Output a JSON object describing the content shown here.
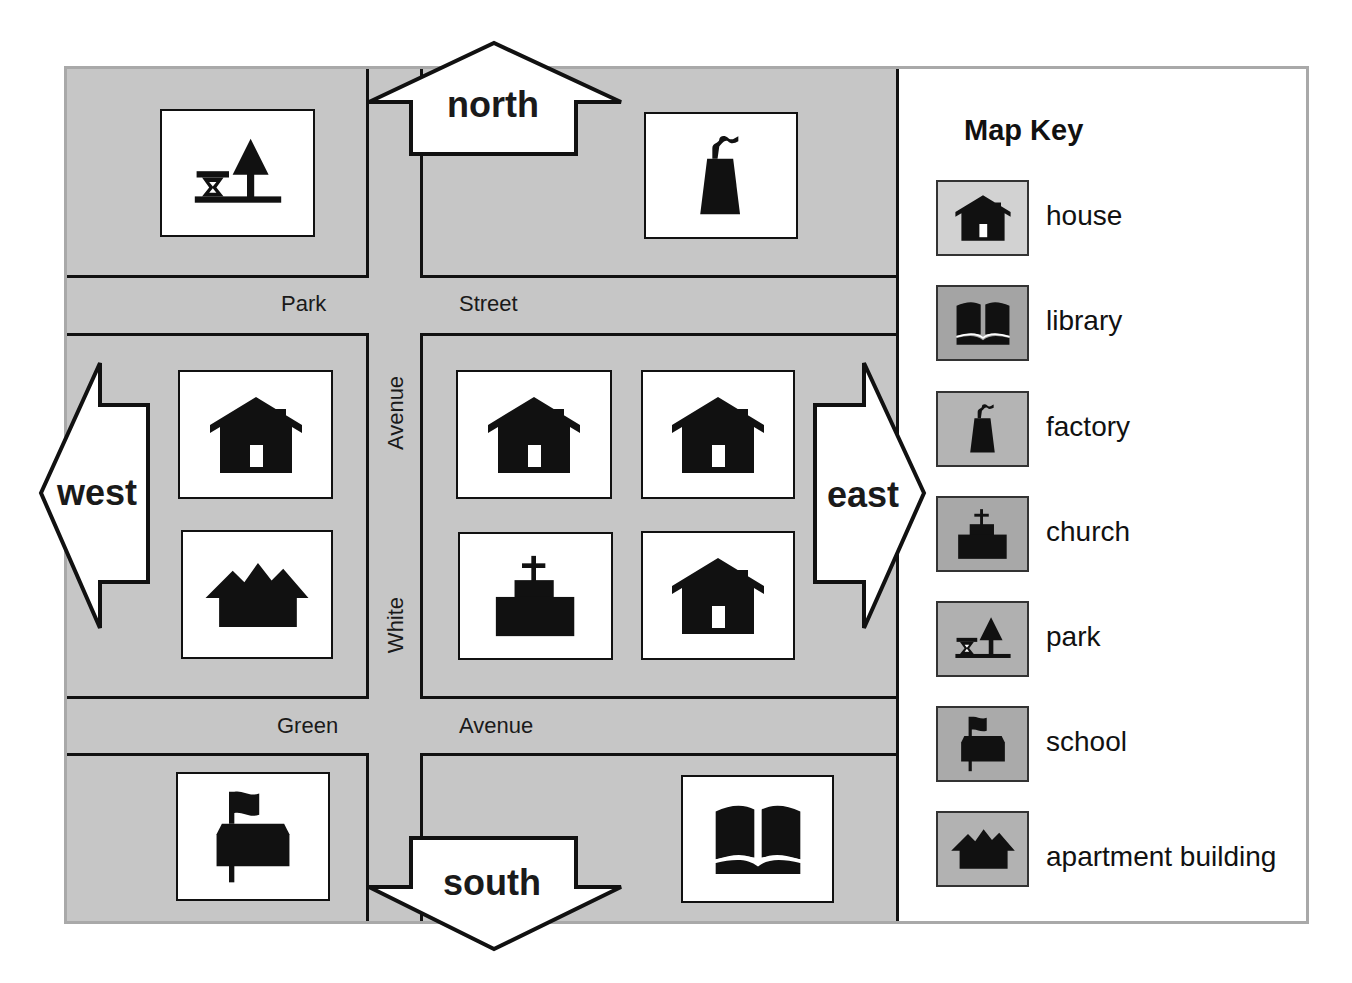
{
  "map": {
    "streets": {
      "horizontal_top": [
        "Park",
        "Street"
      ],
      "horizontal_bottom": [
        "Green",
        "Avenue"
      ],
      "vertical": [
        "White",
        "Avenue"
      ]
    },
    "directions": {
      "north": "north",
      "south": "south",
      "east": "east",
      "west": "west"
    },
    "buildings": [
      {
        "block": "top-left",
        "type": "park"
      },
      {
        "block": "top-right",
        "type": "factory"
      },
      {
        "block": "middle-left",
        "type": "house"
      },
      {
        "block": "middle-left",
        "type": "apartment building"
      },
      {
        "block": "middle-right",
        "type": "house"
      },
      {
        "block": "middle-right",
        "type": "house"
      },
      {
        "block": "middle-right",
        "type": "church"
      },
      {
        "block": "middle-right",
        "type": "house"
      },
      {
        "block": "bottom-left",
        "type": "school"
      },
      {
        "block": "bottom-right",
        "type": "library"
      }
    ],
    "colors": {
      "block_gray": "#c6c6c6",
      "frame_gray": "#a9a9a9",
      "ink": "#111111"
    }
  },
  "key": {
    "title": "Map Key",
    "items": [
      {
        "label": "house",
        "icon": "house-icon",
        "swatch": "#d2d2d2"
      },
      {
        "label": "library",
        "icon": "library-icon",
        "swatch": "#a4a4a4"
      },
      {
        "label": "factory",
        "icon": "factory-icon",
        "swatch": "#b4b4b4"
      },
      {
        "label": "church",
        "icon": "church-icon",
        "swatch": "#a8a8a8"
      },
      {
        "label": "park",
        "icon": "park-icon",
        "swatch": "#b0b0b0"
      },
      {
        "label": "school",
        "icon": "school-icon",
        "swatch": "#aaaaaa"
      },
      {
        "label": "apartment building",
        "icon": "apartment-icon",
        "swatch": "#b2b2b2"
      }
    ]
  }
}
